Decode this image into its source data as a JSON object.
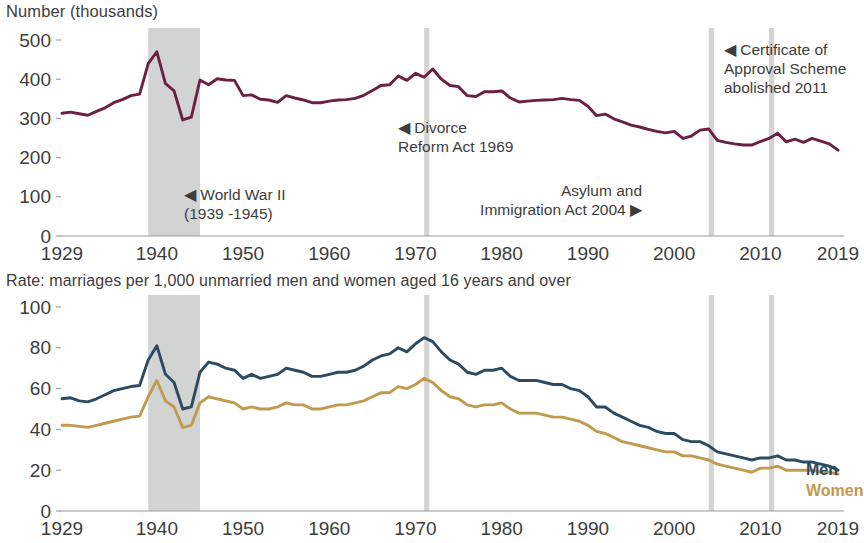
{
  "top": {
    "axis_title": "Number (thousands)",
    "y_ticks": [
      "500",
      "400",
      "300",
      "200",
      "100",
      "0"
    ],
    "x_ticks": [
      "1929",
      "1940",
      "1950",
      "1960",
      "1970",
      "1980",
      "1990",
      "2000",
      "2010",
      "2019"
    ],
    "annotations": [
      {
        "id": "ww2",
        "lines": [
          "◀ World War II",
          "(1939 -1945)"
        ]
      },
      {
        "id": "divorce",
        "lines": [
          "◀ Divorce",
          "Reform Act 1969"
        ]
      },
      {
        "id": "asylum",
        "lines": [
          "Asylum and",
          "Immigration Act 2004 ▶"
        ]
      },
      {
        "id": "certificate",
        "lines": [
          "◀ Certificate of",
          "Approval Scheme",
          "abolished 2011"
        ]
      }
    ]
  },
  "bottom": {
    "sub_title": "Rate: marriages per 1,000 unmarried men and women aged 16 years and over",
    "y_ticks": [
      "100",
      "80",
      "60",
      "40",
      "20",
      "0"
    ],
    "x_ticks": [
      "1929",
      "1940",
      "1950",
      "1960",
      "1970",
      "1980",
      "1990",
      "2000",
      "2010",
      "2019"
    ],
    "legend": [
      {
        "id": "men",
        "label": "Men",
        "color": "#2d4a63"
      },
      {
        "id": "women",
        "label": "Women",
        "color": "#c19a4e"
      }
    ]
  },
  "colors": {
    "marriages_line": "#6b1f42",
    "men_line": "#2d4a63",
    "women_line": "#c19a4e",
    "band": "#d2d4d3",
    "axis": "#9a9a9a",
    "text": "#3d3d3d"
  },
  "chart_data": [
    {
      "type": "line",
      "id": "marriages-number",
      "title": "Number (thousands)",
      "xlabel": "",
      "ylabel": "Number (thousands)",
      "xlim": [
        1929,
        2019
      ],
      "ylim": [
        0,
        500
      ],
      "y_ticks": [
        0,
        100,
        200,
        300,
        400,
        500
      ],
      "x_ticks": [
        1929,
        1940,
        1950,
        1960,
        1970,
        1980,
        1990,
        2000,
        2010,
        2019
      ],
      "grid": false,
      "legend": "none",
      "shaded_bands": [
        {
          "label": "World War II (1939 -1945)",
          "x0": 1939,
          "x1": 1945
        },
        {
          "label": "Divorce Reform Act 1969",
          "x0": 1971,
          "x1": 1971.6
        },
        {
          "label": "Asylum and Immigration Act 2004",
          "x0": 2004,
          "x1": 2004.6
        },
        {
          "label": "Certificate of Approval Scheme abolished 2011",
          "x0": 2011,
          "x1": 2011.6
        }
      ],
      "x": [
        1929,
        1930,
        1931,
        1932,
        1933,
        1934,
        1935,
        1936,
        1937,
        1938,
        1939,
        1940,
        1941,
        1942,
        1943,
        1944,
        1945,
        1946,
        1947,
        1948,
        1949,
        1950,
        1951,
        1952,
        1953,
        1954,
        1955,
        1956,
        1957,
        1958,
        1959,
        1960,
        1961,
        1962,
        1963,
        1964,
        1965,
        1966,
        1967,
        1968,
        1969,
        1970,
        1971,
        1972,
        1973,
        1974,
        1975,
        1976,
        1977,
        1978,
        1979,
        1980,
        1981,
        1982,
        1983,
        1984,
        1985,
        1986,
        1987,
        1988,
        1989,
        1990,
        1991,
        1992,
        1993,
        1994,
        1995,
        1996,
        1997,
        1998,
        1999,
        2000,
        2001,
        2002,
        2003,
        2004,
        2005,
        2006,
        2007,
        2008,
        2009,
        2010,
        2011,
        2012,
        2013,
        2014,
        2015,
        2016,
        2017,
        2018,
        2019
      ],
      "values": [
        313,
        316,
        312,
        308,
        318,
        327,
        340,
        348,
        358,
        362,
        440,
        470,
        389,
        370,
        296,
        303,
        398,
        386,
        401,
        398,
        397,
        358,
        360,
        349,
        347,
        341,
        358,
        352,
        347,
        340,
        340,
        344,
        347,
        348,
        351,
        359,
        371,
        384,
        386,
        408,
        397,
        415,
        405,
        426,
        400,
        384,
        381,
        358,
        356,
        368,
        368,
        370,
        352,
        342,
        344,
        346,
        347,
        348,
        351,
        348,
        346,
        331,
        307,
        311,
        299,
        291,
        283,
        278,
        272,
        267,
        263,
        267,
        249,
        255,
        270,
        273,
        244,
        239,
        235,
        232,
        232,
        241,
        249,
        262,
        240,
        247,
        239,
        249,
        242,
        235,
        219
      ]
    },
    {
      "type": "line",
      "id": "marriage-rate",
      "title": "Rate: marriages per 1,000 unmarried men and women aged 16 years and over",
      "xlabel": "",
      "ylabel": "Rate per 1,000",
      "xlim": [
        1929,
        2019
      ],
      "ylim": [
        0,
        100
      ],
      "y_ticks": [
        0,
        20,
        40,
        60,
        80,
        100
      ],
      "x_ticks": [
        1929,
        1940,
        1950,
        1960,
        1970,
        1980,
        1990,
        2000,
        2010,
        2019
      ],
      "grid": false,
      "legend": "right",
      "shaded_bands": [
        {
          "label": "World War II (1939 -1945)",
          "x0": 1939,
          "x1": 1945
        },
        {
          "label": "Divorce Reform Act 1969",
          "x0": 1971,
          "x1": 1971.6
        },
        {
          "label": "Asylum and Immigration Act 2004",
          "x0": 2004,
          "x1": 2004.6
        },
        {
          "label": "Certificate of Approval Scheme abolished 2011",
          "x0": 2011,
          "x1": 2011.6
        }
      ],
      "x": [
        1929,
        1930,
        1931,
        1932,
        1933,
        1934,
        1935,
        1936,
        1937,
        1938,
        1939,
        1940,
        1941,
        1942,
        1943,
        1944,
        1945,
        1946,
        1947,
        1948,
        1949,
        1950,
        1951,
        1952,
        1953,
        1954,
        1955,
        1956,
        1957,
        1958,
        1959,
        1960,
        1961,
        1962,
        1963,
        1964,
        1965,
        1966,
        1967,
        1968,
        1969,
        1970,
        1971,
        1972,
        1973,
        1974,
        1975,
        1976,
        1977,
        1978,
        1979,
        1980,
        1981,
        1982,
        1983,
        1984,
        1985,
        1986,
        1987,
        1988,
        1989,
        1990,
        1991,
        1992,
        1993,
        1994,
        1995,
        1996,
        1997,
        1998,
        1999,
        2000,
        2001,
        2002,
        2003,
        2004,
        2005,
        2006,
        2007,
        2008,
        2009,
        2010,
        2011,
        2012,
        2013,
        2014,
        2015,
        2016,
        2017,
        2018,
        2019
      ],
      "series": [
        {
          "name": "Men",
          "color": "#2d4a63",
          "values": [
            55,
            55.5,
            54,
            53.5,
            55,
            57,
            59,
            60,
            61,
            61.5,
            74,
            81,
            67,
            63,
            50,
            51,
            68,
            73,
            72,
            70,
            69,
            65,
            67,
            65,
            66,
            67,
            70,
            69,
            68,
            66,
            66,
            67,
            68,
            68,
            69,
            71,
            74,
            76,
            77,
            80,
            78,
            82,
            85,
            83,
            78,
            74,
            72,
            68,
            67,
            69,
            69,
            70,
            66,
            64,
            64,
            64,
            63,
            62,
            62,
            60,
            59,
            56,
            51,
            51,
            48,
            46,
            44,
            42,
            41,
            39,
            38,
            38,
            35,
            34,
            34,
            32,
            29,
            28,
            27,
            26,
            25,
            26,
            26,
            27,
            25,
            25,
            24,
            24,
            23,
            22,
            20
          ]
        },
        {
          "name": "Women",
          "color": "#c19a4e",
          "values": [
            42,
            42,
            41.5,
            41,
            42,
            43,
            44,
            45,
            46,
            46.5,
            56,
            64,
            54,
            51,
            41,
            42,
            53,
            56,
            55,
            54,
            53,
            50,
            51,
            50,
            50,
            51,
            53,
            52,
            52,
            50,
            50,
            51,
            52,
            52,
            53,
            54,
            56,
            58,
            58,
            61,
            60,
            62,
            65,
            63,
            59,
            56,
            55,
            52,
            51,
            52,
            52,
            53,
            50,
            48,
            48,
            48,
            47,
            46,
            46,
            45,
            44,
            42,
            39,
            38,
            36,
            34,
            33,
            32,
            31,
            30,
            29,
            29,
            27,
            27,
            26,
            25,
            23,
            22,
            21,
            20,
            19,
            21,
            21,
            22,
            20,
            20,
            20,
            20,
            19,
            19,
            18
          ]
        }
      ]
    }
  ]
}
